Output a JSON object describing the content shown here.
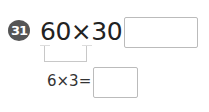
{
  "problem": {
    "number": "31",
    "expression": "60×30=",
    "answer": "",
    "hint": {
      "expression": "6×3=",
      "answer": ""
    }
  },
  "colors": {
    "badge": "#555555",
    "text": "#222222",
    "box_border": "#bbbbbb",
    "bracket": "#c8c8c8"
  }
}
